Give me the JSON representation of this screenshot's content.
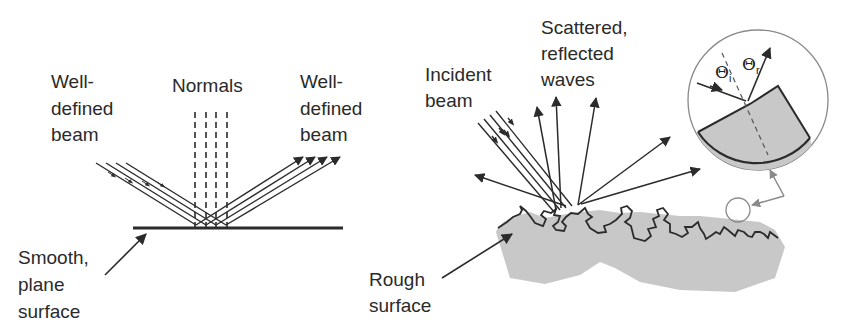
{
  "left_panel": {
    "title": "Specular reflection",
    "labels": {
      "incident": [
        "Well-",
        "defined",
        "beam"
      ],
      "normals": "Normals",
      "reflected": [
        "Well-",
        "defined",
        "beam"
      ],
      "surface": [
        "Smooth,",
        "plane",
        "surface"
      ]
    }
  },
  "right_panel": {
    "title": "Diffuse reflection",
    "labels": {
      "incident": [
        "Incident",
        "beam"
      ],
      "scattered": [
        "Scattered,",
        "reflected",
        "waves"
      ],
      "surface": [
        "Rough",
        "surface"
      ]
    },
    "inset": {
      "theta_i": "Θ",
      "theta_i_sub": "i",
      "theta_r": "Θ",
      "theta_r_sub": "r"
    }
  },
  "colors": {
    "line": "#2b2b2b",
    "surface_fill": "#c8c8c8",
    "pointer_gray": "#8a8a8a"
  }
}
